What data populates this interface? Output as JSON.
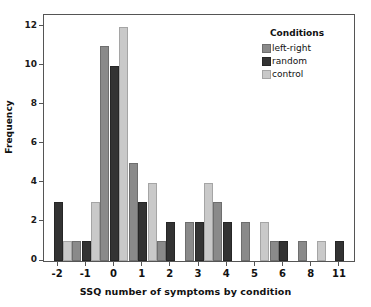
{
  "chart_data": {
    "type": "bar",
    "title": "",
    "xlabel": "SSQ number of symptoms by condition",
    "ylabel": "Frequency",
    "categories": [
      "-2",
      "-1",
      "0",
      "1",
      "2",
      "3",
      "4",
      "5",
      "6",
      "8",
      "11"
    ],
    "ylim": [
      0,
      12.6
    ],
    "yticks": [
      0,
      2,
      4,
      6,
      8,
      10,
      12
    ],
    "ytick_labels": [
      "0",
      "2",
      "4",
      "6",
      "8",
      "10",
      "12"
    ],
    "grid": false,
    "legend_position": "top-right",
    "legend_title": "Conditions",
    "series": [
      {
        "name": "left-right",
        "color": "#8a8a8a",
        "values": [
          0,
          1,
          11,
          5,
          1,
          2,
          3,
          2,
          1,
          1,
          0
        ]
      },
      {
        "name": "random",
        "color": "#333333",
        "values": [
          3,
          1,
          10,
          3,
          2,
          2,
          2,
          0,
          1,
          0,
          1
        ]
      },
      {
        "name": "control",
        "color": "#c9c9c9",
        "values": [
          1,
          3,
          12,
          4,
          0,
          4,
          0,
          2,
          0,
          1,
          0
        ]
      }
    ]
  },
  "legend": {
    "title": "Conditions",
    "entries": [
      {
        "label": "left-right",
        "color": "#8a8a8a"
      },
      {
        "label": "random",
        "color": "#333333"
      },
      {
        "label": "control",
        "color": "#c9c9c9"
      }
    ]
  },
  "axes": {
    "y_title": "Frequency",
    "x_title": "SSQ number of symptoms by condition"
  }
}
